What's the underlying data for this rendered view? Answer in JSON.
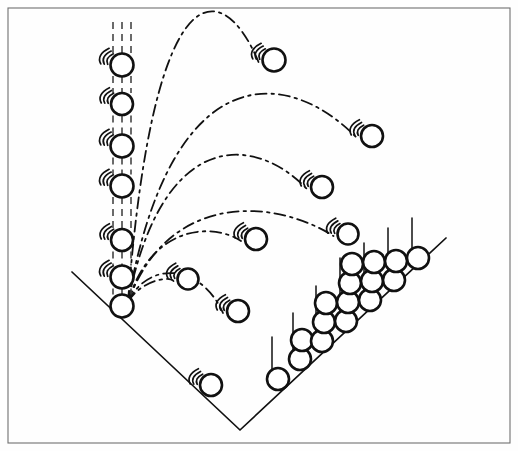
{
  "figure": {
    "background_color": "#fefefe",
    "ink_color": "#111111",
    "frame_color": "#6f6f6f"
  },
  "frame": {
    "x": 8,
    "y": 8,
    "width": 502,
    "height": 435
  },
  "chart_data": {
    "type": "scatter",
    "title": "",
    "xlabel": "",
    "ylabel": "",
    "grid": false,
    "legend": "none",
    "launch_origin": {
      "x": 128,
      "y": 302
    },
    "ground_axes": {
      "left_ray_start": {
        "x": 72,
        "y": 272
      },
      "vertex": {
        "x": 240,
        "y": 430
      },
      "right_ray_end": {
        "x": 446,
        "y": 238
      }
    },
    "vertical_axis": {
      "x": 122,
      "top": 22,
      "bottom": 306,
      "marker_count": 7,
      "markers": [
        {
          "cy": 65,
          "r": 11.5,
          "swoosh": true,
          "stem_above": true
        },
        {
          "cy": 104,
          "r": 11.0,
          "swoosh": true,
          "stem_above": true
        },
        {
          "cy": 146,
          "r": 11.5,
          "swoosh": true,
          "stem_above": true
        },
        {
          "cy": 186,
          "r": 11.5,
          "swoosh": true,
          "stem_above": true
        },
        {
          "cy": 240,
          "r": 11.0,
          "swoosh": true,
          "stem_above": true
        },
        {
          "cy": 277,
          "r": 11.5,
          "swoosh": true,
          "stem_above": true
        },
        {
          "cy": 306,
          "r": 11.5,
          "swoosh": false,
          "stem_above": true
        }
      ]
    },
    "trajectories": [
      {
        "id": 1,
        "peak_height_px": 248,
        "range_px": 146,
        "end": {
          "x": 274,
          "y": 60
        },
        "end_marker_r": 11.5
      },
      {
        "id": 2,
        "peak_height_px": 180,
        "range_px": 244,
        "end": {
          "x": 372,
          "y": 136
        },
        "end_marker_r": 11.0
      },
      {
        "id": 3,
        "peak_height_px": 128,
        "range_px": 198,
        "end": {
          "x": 322,
          "y": 187
        },
        "end_marker_r": 11.0
      },
      {
        "id": 4,
        "peak_height_px": 80,
        "range_px": 220,
        "end": {
          "x": 348,
          "y": 234
        },
        "end_marker_r": 10.5
      },
      {
        "id": 5,
        "peak_height_px": 56,
        "range_px": 128,
        "end": {
          "x": 256,
          "y": 239
        },
        "end_marker_r": 11.0
      },
      {
        "id": 6,
        "peak_height_px": 30,
        "range_px": 110,
        "end": {
          "x": 238,
          "y": 311
        },
        "end_marker_r": 11.0
      },
      {
        "id": 7,
        "peak_height_px": 14,
        "range_px": 60,
        "end": {
          "x": 188,
          "y": 279
        },
        "end_marker_r": 10.5
      }
    ],
    "ground_marker_left_ray": [
      {
        "x": 211,
        "y": 385,
        "r": 11.0,
        "swoosh": true
      }
    ],
    "stem_stacks_right_ray": [
      {
        "index": 1,
        "base": {
          "x": 272,
          "y": 381
        },
        "stem_top_y": 337,
        "counts": 1,
        "balls": [
          {
            "cx": 278,
            "cy": 379,
            "r": 11.0
          }
        ]
      },
      {
        "index": 2,
        "base": {
          "x": 293,
          "y": 363
        },
        "stem_top_y": 313,
        "counts": 2,
        "balls": [
          {
            "cx": 300,
            "cy": 359,
            "r": 11.0
          },
          {
            "cx": 302,
            "cy": 340,
            "r": 11.0
          }
        ]
      },
      {
        "index": 3,
        "base": {
          "x": 316,
          "y": 344
        },
        "stem_top_y": 286,
        "counts": 3,
        "balls": [
          {
            "cx": 322,
            "cy": 341,
            "r": 11.0
          },
          {
            "cx": 324,
            "cy": 322,
            "r": 11.0
          },
          {
            "cx": 326,
            "cy": 303,
            "r": 11.0
          }
        ]
      },
      {
        "index": 4,
        "base": {
          "x": 340,
          "y": 324
        },
        "stem_top_y": 258,
        "counts": 4,
        "balls": [
          {
            "cx": 346,
            "cy": 321,
            "r": 11.0
          },
          {
            "cx": 348,
            "cy": 302,
            "r": 11.0
          },
          {
            "cx": 350,
            "cy": 283,
            "r": 11.0
          },
          {
            "cx": 352,
            "cy": 264,
            "r": 11.0
          }
        ]
      },
      {
        "index": 5,
        "base": {
          "x": 364,
          "y": 303
        },
        "stem_top_y": 243,
        "counts": 3,
        "balls": [
          {
            "cx": 370,
            "cy": 300,
            "r": 11.0
          },
          {
            "cx": 372,
            "cy": 281,
            "r": 11.0
          },
          {
            "cx": 374,
            "cy": 262,
            "r": 11.0
          }
        ]
      },
      {
        "index": 6,
        "base": {
          "x": 388,
          "y": 283
        },
        "stem_top_y": 228,
        "counts": 2,
        "balls": [
          {
            "cx": 394,
            "cy": 280,
            "r": 11.0
          },
          {
            "cx": 396,
            "cy": 261,
            "r": 11.0
          }
        ]
      },
      {
        "index": 7,
        "base": {
          "x": 412,
          "y": 262
        },
        "stem_top_y": 218,
        "counts": 1,
        "balls": [
          {
            "cx": 418,
            "cy": 258,
            "r": 11.0
          }
        ]
      }
    ],
    "marker_total": 36,
    "marker_style": {
      "fill": "#ffffff",
      "stroke": "#111111",
      "stroke_width": 2.6,
      "radius_px": 11
    },
    "line_style": {
      "trajectory": "dash-dot",
      "stem": "solid",
      "axis": "solid"
    }
  }
}
